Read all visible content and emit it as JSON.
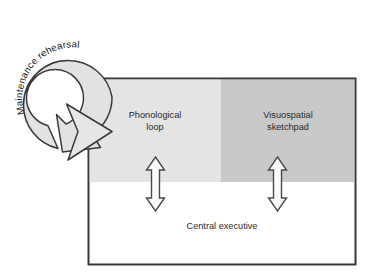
{
  "diagram": {
    "colors": {
      "phonological_fill": "#e4e4e4",
      "visuospatial_fill": "#c9c9c9",
      "central_executive_fill": "#ffffff",
      "arc_fill": "#e2e2e2",
      "outline": "#3a3a3a",
      "text": "#2a2a2a",
      "page_background": "#ffffff"
    },
    "arc": {
      "label": "Maintenance rehearsal",
      "direction": "clockwise-into-phonological-loop"
    },
    "main_box": {
      "label": "Central executive",
      "panels": [
        {
          "id": "phonological-loop",
          "label_line1": "Phonological",
          "label_line2": "loop",
          "fill": "#e4e4e4"
        },
        {
          "id": "visuospatial-sketchpad",
          "label_line1": "Visuospatial",
          "label_line2": "sketchpad",
          "fill": "#c9c9c9"
        }
      ]
    },
    "connectors": [
      {
        "id": "phonological-to-central",
        "type": "double-headed-vertical-arrow"
      },
      {
        "id": "visuospatial-to-central",
        "type": "double-headed-vertical-arrow"
      }
    ]
  }
}
